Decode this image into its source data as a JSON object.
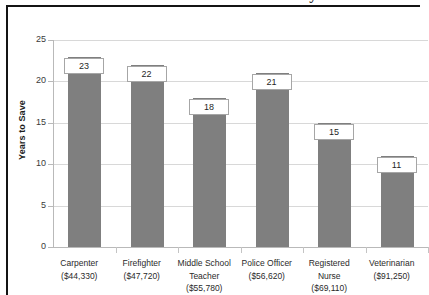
{
  "chart_data": {
    "type": "bar",
    "title": "Years Needed to Save for a Down Payment",
    "xlabel": "",
    "ylabel": "Years to Save",
    "ylim": [
      0,
      25
    ],
    "yticks": [
      0,
      5,
      10,
      15,
      20,
      25
    ],
    "grid": true,
    "legend": "none",
    "bar_color": "#7f7f7f",
    "categories": [
      "Carpenter",
      "Firefighter",
      "Middle School Teacher",
      "Police Officer",
      "Registered Nurse",
      "Veterinarian"
    ],
    "category_salaries": [
      "($44,330)",
      "($47,720)",
      "($55,780)",
      "($56,620)",
      "($69,110)",
      "($91,250)"
    ],
    "category_lines": [
      [
        "Carpenter",
        "($44,330)"
      ],
      [
        "Firefighter",
        "($47,720)"
      ],
      [
        "Middle School",
        "Teacher",
        "($55,780)"
      ],
      [
        "Police Officer",
        "($56,620)"
      ],
      [
        "Registered",
        "Nurse",
        "($69,110)"
      ],
      [
        "Veterinarian",
        "($91,250)"
      ]
    ],
    "values": [
      23,
      22,
      18,
      21,
      15,
      11
    ],
    "data_labels": [
      "23",
      "22",
      "18",
      "21",
      "15",
      "11"
    ]
  }
}
